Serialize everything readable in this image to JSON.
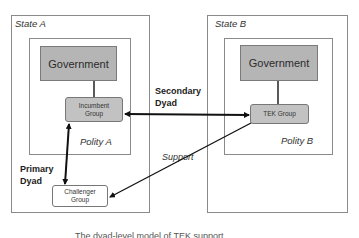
{
  "diagram": {
    "state_a": {
      "label": "State A",
      "polity": {
        "label": "Polity A"
      },
      "government": {
        "label": "Government"
      },
      "incumbent_group": {
        "label_line1": "Incumbent",
        "label_line2": "Group"
      },
      "challenger_group": {
        "label_line1": "Challenger",
        "label_line2": "Group"
      }
    },
    "state_b": {
      "label": "State B",
      "polity": {
        "label": "Polity B"
      },
      "government": {
        "label": "Government"
      },
      "tek_group": {
        "label": "TEK Group"
      }
    },
    "relations": {
      "primary_dyad": {
        "line1": "Primary",
        "line2": "Dyad"
      },
      "secondary_dyad": {
        "line1": "Secondary",
        "line2": "Dyad"
      },
      "support": {
        "label": "Support"
      }
    },
    "caption": "The dyad-level model of TEK support"
  },
  "colors": {
    "box_fill": "#b5b5b5",
    "group_fill": "#c2c2c2",
    "border": "#8a8a8a",
    "arrow": "#111111"
  }
}
